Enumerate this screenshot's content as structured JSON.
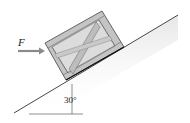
{
  "figure": {
    "force_label": "F",
    "angle_label": "30°",
    "colors": {
      "line": "#333333",
      "crate_fill": "#c8c8c8",
      "crate_frame": "#b4b4b4",
      "crate_inner": "#dcdcdc",
      "arrow": "#8a8a8a",
      "shading": "#eeeeee"
    }
  }
}
